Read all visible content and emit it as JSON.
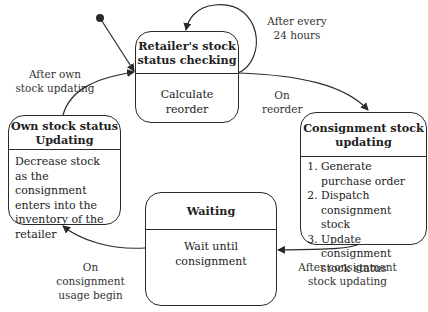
{
  "states": {
    "retailer": {
      "title": "Retailer's stock status checking",
      "activity": "Calculate reorder"
    },
    "consignment": {
      "title": "Consignment stock updating",
      "activities": [
        "Generate purchase order",
        "Dispatch consignment stock",
        "Update consignment stock status"
      ]
    },
    "waiting": {
      "title": "Waiting",
      "activity": "Wait until consignment"
    },
    "own_stock": {
      "title": "Own stock status Updating",
      "activity": "Decrease stock as the consignment enters into the inventory of the retailer"
    }
  },
  "transitions": {
    "self_loop": "After every 24 hours",
    "on_reorder": "On reorder",
    "after_consignment": "After consignment stock updating",
    "on_usage": "On consignment usage begin",
    "after_own": "After own stock updating"
  },
  "colors": {
    "line": "#2a2a2a",
    "background": "#ffffff"
  }
}
